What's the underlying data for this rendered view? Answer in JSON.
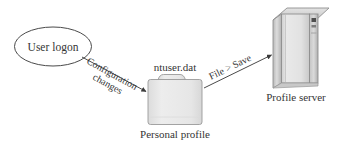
{
  "diagram": {
    "background_color": "#ffffff",
    "stroke_color": "#4a4a4a",
    "text_color": "#353535",
    "node_fill": "#e9e9e9",
    "nodes": {
      "user_logon": {
        "label": "User logon",
        "shape": "ellipse"
      },
      "personal_profile": {
        "shape": "folder",
        "top_label": "ntuser.dat",
        "caption": "Personal profile"
      },
      "profile_server": {
        "shape": "server-tower",
        "caption": "Profile server"
      }
    },
    "edges": [
      {
        "from": "user_logon",
        "to": "personal_profile",
        "label_line1": "Configuration",
        "label_line2": "changes",
        "direction": "down-right",
        "angle_deg": 29
      },
      {
        "from": "personal_profile",
        "to": "profile_server",
        "label": "File > Save",
        "direction": "up-right",
        "angle_deg": -26
      }
    ]
  }
}
